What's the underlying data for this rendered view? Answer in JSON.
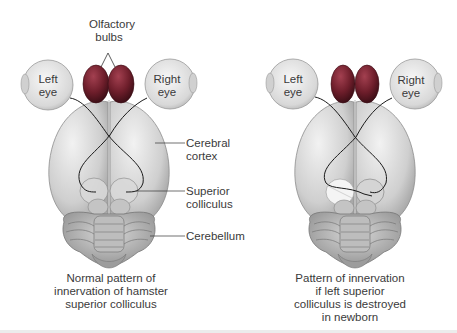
{
  "figure": {
    "left_panel": {
      "labels": {
        "olfactory_bulbs_line1": "Olfactory",
        "olfactory_bulbs_line2": "bulbs",
        "left_eye_line1": "Left",
        "left_eye_line2": "eye",
        "right_eye_line1": "Right",
        "right_eye_line2": "eye",
        "cerebral_cortex_line1": "Cerebral",
        "cerebral_cortex_line2": "cortex",
        "superior_colliculus_line1": "Superior",
        "superior_colliculus_line2": "colliculus",
        "cerebellum": "Cerebellum"
      },
      "caption": {
        "line1": "Normal pattern of",
        "line2": "innervation of hamster",
        "line3": "superior colliculus"
      }
    },
    "right_panel": {
      "labels": {
        "left_eye_line1": "Left",
        "left_eye_line2": "eye",
        "right_eye_line1": "Right",
        "right_eye_line2": "eye"
      },
      "caption": {
        "line1": "Pattern of innervation",
        "line2": "if left superior",
        "line3": "colliculus is destroyed",
        "line4": "in newborn"
      }
    },
    "colors": {
      "olfactory_bulb": "#7a2230",
      "brain": "#d6d6d6",
      "eye": "#e4e4e4",
      "nerve": "#1a1a1a",
      "label_text": "#3a3a3a"
    }
  }
}
